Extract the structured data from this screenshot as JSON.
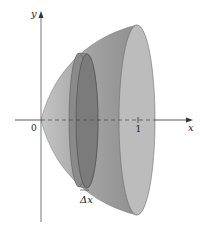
{
  "figure": {
    "axes": {
      "x_label": "x",
      "y_label": "y",
      "origin_label": "0",
      "x_tick_label": "1"
    },
    "slice_label": "Δx",
    "colors": {
      "solid_surface": "#a9a9a9",
      "solid_dark": "#8c8c8c",
      "end_cap": "#b9b9b9",
      "disk_face": "#7d7d7d",
      "disk_rim": "#959595",
      "axis": "#333333",
      "background": "#ffffff"
    }
  }
}
